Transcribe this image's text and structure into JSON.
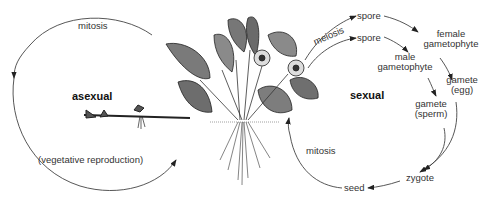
{
  "diagram": {
    "asexual_cycle": {
      "title": "asexual",
      "top_label": "mitosis",
      "bottom_label": "(vegetative reproduction)"
    },
    "sexual_cycle": {
      "title": "sexual",
      "meiosis_label": "meiosis",
      "stages": {
        "spore_female": "spore",
        "spore_male": "spore",
        "female_gametophyte": "female gametophyte",
        "female_gametophyte_line1": "female",
        "female_gametophyte_line2": "gametophyte",
        "male_gametophyte_line1": "male",
        "male_gametophyte_line2": "gametophyte",
        "gamete_egg_line1": "gamete",
        "gamete_egg_line2": "(egg)",
        "gamete_sperm_line1": "gamete",
        "gamete_sperm_line2": "(sperm)",
        "zygote": "zygote",
        "seed": "seed"
      },
      "return_label": "mitosis"
    },
    "central_illustration": "strawberry-plant-with-runner"
  }
}
